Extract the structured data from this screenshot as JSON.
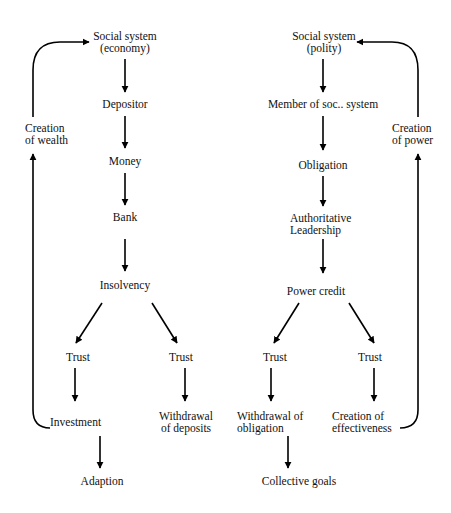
{
  "diagram": {
    "type": "flowchart",
    "economy": {
      "root": {
        "line1": "Social system",
        "line2": "(economy)"
      },
      "depositor": "Depositor",
      "money": "Money",
      "bank": "Bank",
      "insolvency": "Insolvency",
      "trust_left": "Trust",
      "trust_right": "Trust",
      "investment": "Investment",
      "withdrawal": {
        "line1": "Withdrawal",
        "line2": "of deposits"
      },
      "adaption": "Adaption",
      "loop": {
        "line1": "Creation",
        "line2": "of wealth"
      }
    },
    "polity": {
      "root": {
        "line1": "Social system",
        "line2": "(polity)"
      },
      "member": "Member of soc.. system",
      "obligation": "Obligation",
      "leadership": {
        "line1": "Authoritative",
        "line2": "Leadership"
      },
      "power_credit": "Power credit",
      "trust_left": "Trust",
      "trust_right": "Trust",
      "withdrawal": {
        "line1": "Withdrawal of",
        "line2": "obligation"
      },
      "effectiveness": {
        "line1": "Creation of",
        "line2": "effectiveness"
      },
      "collective_goals": "Collective goals",
      "loop": {
        "line1": "Creation",
        "line2": "of power"
      }
    },
    "edges": [
      [
        "Social system (economy)",
        "Depositor"
      ],
      [
        "Depositor",
        "Money"
      ],
      [
        "Money",
        "Bank"
      ],
      [
        "Bank",
        "Insolvency"
      ],
      [
        "Insolvency",
        "Trust (left)"
      ],
      [
        "Insolvency",
        "Trust (right)"
      ],
      [
        "Trust (left)",
        "Investment"
      ],
      [
        "Trust (right)",
        "Withdrawal of deposits"
      ],
      [
        "Investment",
        "Adaption"
      ],
      [
        "Investment",
        "Creation of wealth"
      ],
      [
        "Creation of wealth",
        "Social system (economy)"
      ],
      [
        "Social system (polity)",
        "Member of soc.. system"
      ],
      [
        "Member of soc.. system",
        "Obligation"
      ],
      [
        "Obligation",
        "Authoritative Leadership"
      ],
      [
        "Authoritative Leadership",
        "Power credit"
      ],
      [
        "Power credit",
        "Trust (left)"
      ],
      [
        "Power credit",
        "Trust (right)"
      ],
      [
        "Trust (left)",
        "Withdrawal of obligation"
      ],
      [
        "Trust (right)",
        "Creation of effectiveness"
      ],
      [
        "Withdrawal of obligation",
        "Collective goals"
      ],
      [
        "Creation of effectiveness",
        "Creation of power"
      ],
      [
        "Creation of power",
        "Social system (polity)"
      ]
    ]
  }
}
